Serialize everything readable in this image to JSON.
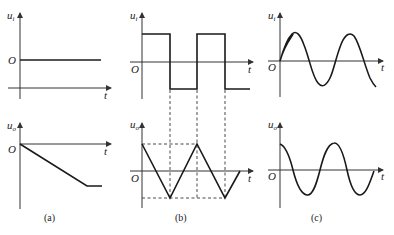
{
  "figure": {
    "panels": [
      {
        "id": "a",
        "caption": "(a)",
        "input": {
          "axis_label": "u",
          "axis_sub": "i",
          "origin": "O",
          "time_label": "t",
          "waveform": "constant (positive DC level)"
        },
        "output": {
          "axis_label": "u",
          "axis_sub": "o",
          "origin": "O",
          "time_label": "t",
          "waveform": "linear ramp down from 0, then saturates at constant negative level"
        }
      },
      {
        "id": "b",
        "caption": "(b)",
        "input": {
          "axis_label": "u",
          "axis_sub": "i",
          "origin": "O",
          "time_label": "t",
          "waveform": "square wave"
        },
        "output": {
          "axis_label": "u",
          "axis_sub": "o",
          "origin": "O",
          "time_label": "t",
          "waveform": "triangle wave"
        },
        "guides": "dashed vertical lines aligning square-wave edges with triangle peaks/troughs; dashed horizontal lines marking peak levels"
      },
      {
        "id": "c",
        "caption": "(c)",
        "input": {
          "axis_label": "u",
          "axis_sub": "i",
          "origin": "O",
          "time_label": "t",
          "waveform": "sine wave"
        },
        "output": {
          "axis_label": "u",
          "axis_sub": "o",
          "origin": "O",
          "time_label": "t",
          "waveform": "cosine wave (phase-shifted sine)"
        }
      }
    ]
  }
}
